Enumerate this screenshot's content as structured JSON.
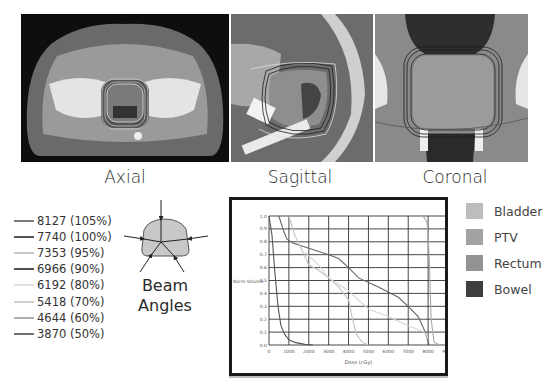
{
  "panels": [
    {
      "id": "axial",
      "caption": "Axial"
    },
    {
      "id": "sagittal",
      "caption": "Sagittal"
    },
    {
      "id": "coronal",
      "caption": "Coronal"
    }
  ],
  "isodose_legend": [
    {
      "dose": "8127",
      "pct": "(105%)",
      "color": "#7a7a7a"
    },
    {
      "dose": "7740",
      "pct": "(100%)",
      "color": "#555555"
    },
    {
      "dose": "7353",
      "pct": "(95%)",
      "color": "#c8c8c8"
    },
    {
      "dose": "6966",
      "pct": "(90%)",
      "color": "#505050"
    },
    {
      "dose": "6192",
      "pct": "(80%)",
      "color": "#e2e2e2"
    },
    {
      "dose": "5418",
      "pct": "(70%)",
      "color": "#cfcfcf"
    },
    {
      "dose": "4644",
      "pct": "(60%)",
      "color": "#b0b0b0"
    },
    {
      "dose": "3870",
      "pct": "(50%)",
      "color": "#707070"
    }
  ],
  "beam": {
    "line1": "Beam",
    "line2": "Angles"
  },
  "structure_legend": [
    {
      "label": "Bladder",
      "color": "#bdbdbd"
    },
    {
      "label": "PTV",
      "color": "#a3a3a3"
    },
    {
      "label": "Rectum",
      "color": "#939393"
    },
    {
      "label": "Bowel",
      "color": "#3e3e3e"
    }
  ],
  "chart_data": {
    "type": "line",
    "title": "",
    "xlabel": "Dose (cGy)",
    "ylabel": "Norm Volume",
    "xlim": [
      0,
      9000
    ],
    "ylim": [
      0,
      1.0
    ],
    "grid": true,
    "x_ticks": [
      "0",
      "1000",
      "2000",
      "3000",
      "4000",
      "5000",
      "6000",
      "7000",
      "8000",
      "9000"
    ],
    "y_ticks": [
      "0.0",
      "0.1",
      "0.2",
      "0.3",
      "0.4",
      "0.5",
      "0.6",
      "0.7",
      "0.8",
      "0.9",
      "1.0"
    ],
    "series": [
      {
        "name": "Bowel",
        "color": "#555555",
        "x": [
          0,
          150,
          300,
          450,
          600,
          800,
          1000,
          1300,
          1800,
          2200
        ],
        "y": [
          1.0,
          0.85,
          0.55,
          0.3,
          0.15,
          0.08,
          0.04,
          0.02,
          0.005,
          0.0
        ]
      },
      {
        "name": "Rectum",
        "color": "#666666",
        "x": [
          500,
          700,
          900,
          1200,
          2000,
          3000,
          3500,
          4000,
          4500,
          5500,
          6500,
          7000,
          7500,
          7800,
          8000,
          8050
        ],
        "y": [
          1.0,
          0.9,
          0.82,
          0.79,
          0.75,
          0.7,
          0.67,
          0.6,
          0.52,
          0.45,
          0.37,
          0.3,
          0.22,
          0.12,
          0.03,
          0.0
        ]
      },
      {
        "name": "Bladder",
        "color": "#c4c4c4",
        "x": [
          1000,
          1300,
          1700,
          2000,
          2500,
          3000,
          3500,
          4000,
          4200,
          4400,
          4700,
          5000
        ],
        "y": [
          1.0,
          0.85,
          0.72,
          0.62,
          0.58,
          0.52,
          0.45,
          0.35,
          0.2,
          0.08,
          0.02,
          0.0
        ]
      },
      {
        "name": "Rectum-2",
        "color": "#d6d6d6",
        "x": [
          1800,
          2500,
          3000,
          4000,
          5000,
          6000,
          7000,
          7800,
          8000
        ],
        "y": [
          0.72,
          0.62,
          0.52,
          0.42,
          0.28,
          0.22,
          0.15,
          0.1,
          0.05
        ]
      },
      {
        "name": "PTV",
        "color": "#aaaaaa",
        "x": [
          7600,
          7800,
          7950,
          8050,
          8150,
          8300,
          8600,
          9000
        ],
        "y": [
          1.0,
          0.99,
          0.95,
          0.7,
          0.2,
          0.02,
          0.0,
          0.0
        ]
      }
    ]
  }
}
